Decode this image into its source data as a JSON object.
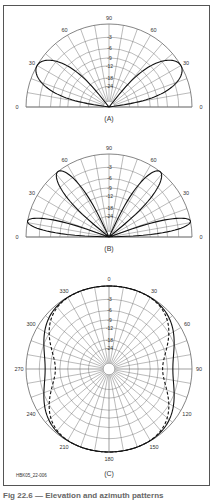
{
  "figure": {
    "id_label": "HBK05_22-006",
    "caption": "Fig 22.6 — Elevation and azimuth patterns",
    "colors": {
      "grid": "#777777",
      "trace": "#111111",
      "label": "#333333",
      "frame": "#555555"
    }
  },
  "chart_data": [
    {
      "type": "polar",
      "subtype": "elevation",
      "panel_label": "(A)",
      "angle_labels": [
        "0",
        "30",
        "60",
        "90",
        "60",
        "30",
        "0"
      ],
      "angle_ticks_deg": [
        0,
        30,
        60,
        90,
        120,
        150,
        180
      ],
      "radial_scale": "ARRL log-periodic",
      "radial_labels_db": [
        "-3",
        "-6",
        "-9",
        "-12",
        "-18",
        "-24"
      ],
      "radial_rings_db": [
        0,
        -3,
        -6,
        -9,
        -12,
        -18,
        -24
      ],
      "series": [
        {
          "name": "pattern",
          "style": "solid",
          "lobes": [
            {
              "peak_elev_deg": 30,
              "peak_db": 0,
              "half_width_deg": 22
            }
          ],
          "symmetric": true
        }
      ],
      "xlim": [
        0,
        180
      ],
      "ylim": [
        -40,
        0
      ],
      "grid": true
    },
    {
      "type": "polar",
      "subtype": "elevation",
      "panel_label": "(B)",
      "angle_labels": [
        "0",
        "30",
        "60",
        "90",
        "60",
        "30",
        "0"
      ],
      "angle_ticks_deg": [
        0,
        30,
        60,
        90,
        120,
        150,
        180
      ],
      "radial_scale": "ARRL log-periodic",
      "radial_labels_db": [
        "-3",
        "-6",
        "-9",
        "-12",
        "-18",
        "-24"
      ],
      "radial_rings_db": [
        0,
        -3,
        -6,
        -9,
        -12,
        -18,
        -24
      ],
      "series": [
        {
          "name": "pattern",
          "style": "solid",
          "lobes": [
            {
              "peak_elev_deg": 11,
              "peak_db": 0,
              "half_width_deg": 9
            },
            {
              "peak_elev_deg": 52,
              "peak_db": 0,
              "half_width_deg": 13
            }
          ],
          "symmetric": true
        }
      ],
      "xlim": [
        0,
        180
      ],
      "ylim": [
        -40,
        0
      ],
      "grid": true
    },
    {
      "type": "polar",
      "subtype": "azimuth",
      "panel_label": "(C)",
      "angle_labels": [
        "0",
        "30",
        "60",
        "90",
        "120",
        "150",
        "180",
        "210",
        "240",
        "270",
        "300",
        "330"
      ],
      "angle_ticks_deg": [
        0,
        30,
        60,
        90,
        120,
        150,
        180,
        210,
        240,
        270,
        300,
        330
      ],
      "radial_scale": "ARRL log-periodic",
      "radial_labels_db": [
        "-3",
        "-6",
        "-9",
        "-12",
        "-18",
        "-24"
      ],
      "radial_rings_db": [
        0,
        -3,
        -6,
        -9,
        -12,
        -18,
        -24
      ],
      "series": [
        {
          "name": "solid trace",
          "style": "solid",
          "min_db_at_90": -4.5
        },
        {
          "name": "dashed trace",
          "style": "dashed",
          "min_db_at_90": -7.5
        }
      ],
      "grid": true
    }
  ]
}
